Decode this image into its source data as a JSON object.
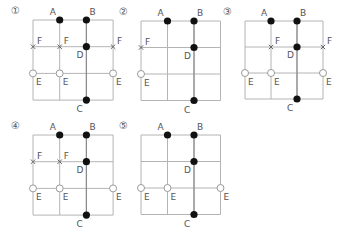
{
  "colors": {
    "grid": "#b4b4b4",
    "dot": "#111111",
    "open_circle_stroke": "#9a9a9a",
    "cross": "#666666",
    "label": "#555555"
  },
  "diagrams": [
    {
      "number": "①",
      "origin": [
        33,
        20
      ],
      "cell": 26.7,
      "solid": [
        {
          "label": "A",
          "col": 1,
          "row": 0
        },
        {
          "label": "B",
          "col": 2,
          "row": 0
        },
        {
          "label": "D",
          "col": 2,
          "row": 1
        },
        {
          "label": "C",
          "col": 2,
          "row": 3
        }
      ],
      "cross": [
        {
          "label": "F",
          "col": 0,
          "row": 1
        },
        {
          "label": "F",
          "col": 1,
          "row": 1
        },
        {
          "label": "F",
          "col": 3,
          "row": 1
        }
      ],
      "open": [
        {
          "label": "E",
          "col": 0,
          "row": 2
        },
        {
          "label": "E",
          "col": 1,
          "row": 2
        },
        {
          "label": "E",
          "col": 3,
          "row": 2
        }
      ]
    },
    {
      "number": "②",
      "origin": [
        141,
        21
      ],
      "cell": 26.5,
      "solid": [
        {
          "label": "A",
          "col": 1,
          "row": 0
        },
        {
          "label": "B",
          "col": 2,
          "row": 0
        },
        {
          "label": "D",
          "col": 2,
          "row": 1
        },
        {
          "label": "C",
          "col": 2,
          "row": 3
        }
      ],
      "cross": [
        {
          "label": "F",
          "col": 0,
          "row": 1
        }
      ],
      "open": [
        {
          "label": "E",
          "col": 0,
          "row": 2
        }
      ]
    },
    {
      "number": "③",
      "origin": [
        245,
        21
      ],
      "cell": 26,
      "solid": [
        {
          "label": "A",
          "col": 1,
          "row": 0
        },
        {
          "label": "B",
          "col": 2,
          "row": 0
        },
        {
          "label": "D",
          "col": 2,
          "row": 1
        },
        {
          "label": "C",
          "col": 2,
          "row": 3
        }
      ],
      "cross": [
        {
          "label": "F",
          "col": 1,
          "row": 1
        },
        {
          "label": "F",
          "col": 3,
          "row": 1
        }
      ],
      "open": [
        {
          "label": "E",
          "col": 0,
          "row": 2
        },
        {
          "label": "E",
          "col": 1,
          "row": 2
        },
        {
          "label": "E",
          "col": 3,
          "row": 2
        }
      ]
    },
    {
      "number": "④",
      "origin": [
        33,
        135
      ],
      "cell": 26.7,
      "solid": [
        {
          "label": "A",
          "col": 1,
          "row": 0
        },
        {
          "label": "B",
          "col": 2,
          "row": 0
        },
        {
          "label": "D",
          "col": 2,
          "row": 1
        },
        {
          "label": "C",
          "col": 2,
          "row": 3
        }
      ],
      "cross": [
        {
          "label": "F",
          "col": 0,
          "row": 1
        },
        {
          "label": "F",
          "col": 1,
          "row": 1
        }
      ],
      "open": [
        {
          "label": "E",
          "col": 0,
          "row": 2
        },
        {
          "label": "E",
          "col": 1,
          "row": 2
        },
        {
          "label": "E",
          "col": 3,
          "row": 2
        }
      ]
    },
    {
      "number": "⑤",
      "origin": [
        141,
        135
      ],
      "cell": 26.5,
      "solid": [
        {
          "label": "A",
          "col": 1,
          "row": 0
        },
        {
          "label": "B",
          "col": 2,
          "row": 0
        },
        {
          "label": "D",
          "col": 2,
          "row": 1
        },
        {
          "label": "C",
          "col": 2,
          "row": 3
        }
      ],
      "cross": [],
      "open": [
        {
          "label": "E",
          "col": 0,
          "row": 2
        },
        {
          "label": "E",
          "col": 1,
          "row": 2
        },
        {
          "label": "E",
          "col": 3,
          "row": 2
        }
      ]
    }
  ]
}
